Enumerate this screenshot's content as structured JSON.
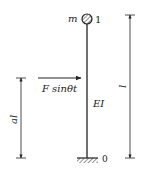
{
  "diagram": {
    "mass_label": "m",
    "top_node_label": "1",
    "bottom_node_label": "0",
    "stiffness_label": "EI",
    "force_label": "F sinθt",
    "length_label": "l",
    "force_height_label": "al"
  },
  "colors": {
    "line": "#222222",
    "background": "#ffffff"
  }
}
